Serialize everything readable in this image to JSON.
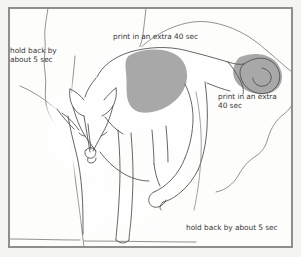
{
  "image": {
    "kind": "hand-drawn-darkroom-printing-map",
    "subject": "dog standing in landscape, outline sketch with dodge and burn zones",
    "width": 301,
    "height": 257
  },
  "colors": {
    "paper": "#fdfdfc",
    "background": "#f4f4f2",
    "frame": "#8e8e8e",
    "ink": "#4a4a48",
    "shade_gray": "#a8a8a8",
    "text": "#3a3a38",
    "halo": "#ffffff"
  },
  "annotations": {
    "top": "print in an extra 40 sec",
    "left": "hold back by\nabout 5 sec",
    "right": "print in an extra\n40 sec",
    "bottom": "hold back by about 5 sec"
  },
  "regions": {
    "shoulder_burn": {
      "label": "print in an extra 40 sec",
      "fill": "#a8a8a8",
      "name": "shoulder-shaded-area"
    },
    "tail_burn": {
      "label": "print in an extra 40 sec",
      "fill": "#a8a8a8",
      "name": "tail-shaded-area"
    },
    "head_dodge": {
      "label": "hold back by about 5 sec",
      "name": "head-dodge-area"
    },
    "foreground_dodge": {
      "label": "hold back by about 5 sec",
      "name": "foreground-dodge-area"
    }
  }
}
